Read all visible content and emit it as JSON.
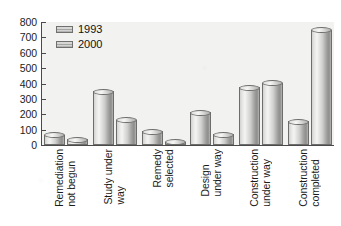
{
  "chart_data": {
    "type": "bar",
    "title": "",
    "subtitle": "",
    "xlabel": "",
    "ylabel": "",
    "ylim": [
      0,
      800
    ],
    "ytick_interval": 100,
    "yticks": [
      800,
      700,
      600,
      500,
      400,
      300,
      200,
      100,
      0
    ],
    "grid": false,
    "legend_position": "top-left",
    "categories": [
      [
        "Remediation",
        "not begun"
      ],
      [
        "Study under",
        "way"
      ],
      [
        "Remedy",
        "selected"
      ],
      [
        "Design",
        "under way"
      ],
      [
        "Construction",
        "under way"
      ],
      [
        "Construction",
        "completed"
      ]
    ],
    "series": [
      {
        "name": "1993",
        "values": [
          68,
          350,
          90,
          215,
          375,
          155
        ]
      },
      {
        "name": "2000",
        "values": [
          38,
          165,
          22,
          70,
          405,
          750
        ]
      }
    ],
    "colors": {
      "bar_light": "#f4f4f2",
      "bar_mid": "#cfcfcd",
      "bar_dark": "#8d8d8b",
      "bar_outline": "#6d6d6b",
      "plot_background": "#f2f2f0",
      "axis": "#4a4a4a",
      "text": "#1c1c1c"
    }
  }
}
